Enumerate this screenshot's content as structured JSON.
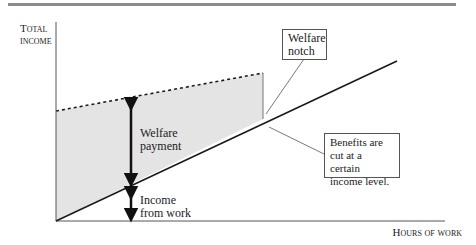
{
  "diagram": {
    "y_axis_label_line1": "Total",
    "y_axis_label_line2": "income",
    "x_axis_label": "Hours of work",
    "annotations": {
      "welfare_payment_line1": "Welfare",
      "welfare_payment_line2": "payment",
      "income_from_work_line1": "Income",
      "income_from_work_line2": "from work",
      "notch_box_line1": "Welfare",
      "notch_box_line2": "notch",
      "benefits_box_line1": "Benefits are",
      "benefits_box_line2": "cut at a certain",
      "benefits_box_line3": "income level."
    },
    "colors": {
      "shaded_area": "#e4e4e4",
      "top_rule": "#8c8c8c",
      "lines": "#1a1a1a"
    }
  }
}
